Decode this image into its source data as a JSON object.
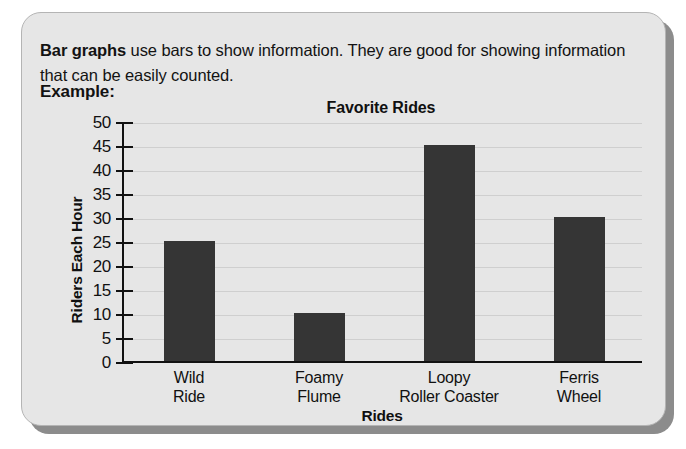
{
  "lesson": {
    "intro_bold": "Bar graphs",
    "intro_rest": " use bars to show information. They are good for showing information that can be easily counted.",
    "example_label": "Example:"
  },
  "colors": {
    "card_background": "#e6e6e6",
    "card_border": "#b4b4b4",
    "card_shadow": "#8c8c8c",
    "bar": "#353535",
    "axis": "#111111",
    "gridline": "#cfcfcf",
    "text": "#131313"
  },
  "chart_data": {
    "type": "bar",
    "title": "Favorite Rides",
    "xlabel": "Rides",
    "ylabel": "Riders Each Hour",
    "categories": [
      "Wild Ride",
      "Foamy Flume",
      "Loopy Roller Coaster",
      "Ferris Wheel"
    ],
    "category_lines": [
      [
        "Wild",
        "Ride"
      ],
      [
        "Foamy",
        "Flume"
      ],
      [
        "Loopy",
        "Roller Coaster"
      ],
      [
        "Ferris",
        "Wheel"
      ]
    ],
    "values": [
      25,
      10,
      45,
      30
    ],
    "ylim": [
      0,
      50
    ],
    "ytick_step": 5,
    "yticks": [
      50,
      45,
      40,
      35,
      30,
      25,
      20,
      15,
      10,
      5,
      0
    ],
    "grid": true,
    "legend": "none"
  }
}
